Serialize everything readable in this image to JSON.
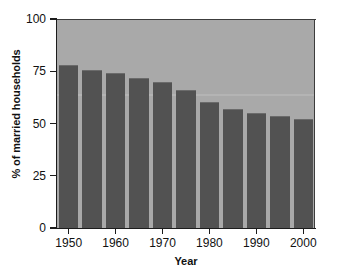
{
  "chart_data": {
    "type": "bar",
    "title": "",
    "xlabel": "Year",
    "ylabel": "% of married households",
    "categories": [
      "1950",
      "1955",
      "1960",
      "1965",
      "1970",
      "1975",
      "1980",
      "1985",
      "1990",
      "1995",
      "2000"
    ],
    "values": [
      78,
      75.5,
      74,
      72,
      70,
      66,
      60.5,
      57,
      55,
      53.5,
      52
    ],
    "x_tick_labels": [
      "1950",
      "1960",
      "1970",
      "1980",
      "1990",
      "2000"
    ],
    "y_tick_labels": [
      "0",
      "25",
      "50",
      "75",
      "100"
    ],
    "y_tick_values": [
      0,
      25,
      50,
      75,
      100
    ],
    "ylim": [
      0,
      100
    ],
    "grid": false,
    "legend": "none",
    "colors": {
      "bar": "#525252",
      "bar_highlight": "#6b6b6b",
      "plot_background": "#a9a9a9",
      "axis": "#1c1c1c",
      "text": "#111111",
      "figure_background": "#ffffff"
    }
  }
}
